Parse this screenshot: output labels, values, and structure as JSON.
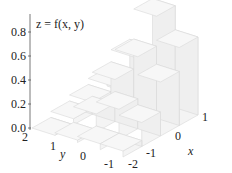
{
  "chart_data": {
    "type": "bar3d",
    "title": "z = f(x, y)",
    "xlabel": "x",
    "ylabel": "y",
    "zlabel": "",
    "x_ticks": [
      "-2",
      "-1",
      "0",
      "1"
    ],
    "y_ticks": [
      "2",
      "1",
      "0",
      "-1"
    ],
    "z_ticks": [
      "0.0",
      "0.2",
      "0.4",
      "0.6",
      "0.8"
    ],
    "zlim": [
      0,
      0.8
    ],
    "x_bins": [
      -2,
      -1,
      0,
      1
    ],
    "y_bins": [
      2,
      1,
      0,
      -1
    ],
    "heights": [
      {
        "x": -2,
        "y": 2,
        "z": 0.0
      },
      {
        "x": -2,
        "y": 1,
        "z": 0.02
      },
      {
        "x": -2,
        "y": 0,
        "z": 0.05
      },
      {
        "x": -2,
        "y": -1,
        "z": 0.05
      },
      {
        "x": -1,
        "y": 2,
        "z": 0.05
      },
      {
        "x": -1,
        "y": 1,
        "z": 0.15
      },
      {
        "x": -1,
        "y": 0,
        "z": 0.25
      },
      {
        "x": -1,
        "y": -1,
        "z": 0.2
      },
      {
        "x": 0,
        "y": 2,
        "z": 0.1
      },
      {
        "x": 0,
        "y": 1,
        "z": 0.35
      },
      {
        "x": 0,
        "y": 0,
        "z": 0.6
      },
      {
        "x": 0,
        "y": -1,
        "z": 0.45
      },
      {
        "x": 1,
        "y": 2,
        "z": 0.15
      },
      {
        "x": 1,
        "y": 1,
        "z": 0.45
      },
      {
        "x": 1,
        "y": 0,
        "z": 0.85
      },
      {
        "x": 1,
        "y": -1,
        "z": 0.65
      }
    ],
    "bar_fill": "#f4f4f4",
    "bar_top_fill": "#f7f7f7",
    "bar_edge": "#d9d9d9",
    "grid": false
  }
}
